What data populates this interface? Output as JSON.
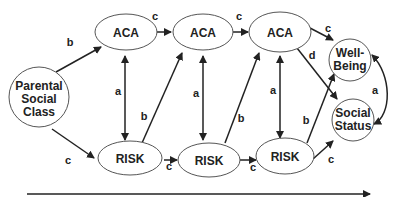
{
  "diagram": {
    "nodes": {
      "parental": {
        "line1": "Parental",
        "line2": "Social",
        "line3": "Class"
      },
      "aca1": {
        "label": "ACA"
      },
      "aca2": {
        "label": "ACA"
      },
      "aca3": {
        "label": "ACA"
      },
      "risk1": {
        "label": "RISK"
      },
      "risk2": {
        "label": "RISK"
      },
      "risk3": {
        "label": "RISK"
      },
      "wellbeing": {
        "line1": "Well-",
        "line2": "Being"
      },
      "socialstatus": {
        "line1": "Social",
        "line2": "Status"
      }
    },
    "edge_labels": {
      "parental_aca1": "b",
      "parental_risk1": "c",
      "aca1_aca2": "c",
      "aca2_aca3": "c",
      "aca3_wellbeing": "c",
      "aca3_socialstatus": "d",
      "risk1_risk2": "c",
      "risk2_risk3": "c",
      "risk3_socialstatus": "c",
      "risk3_wellbeing": "b",
      "risk1_aca2": "b",
      "risk2_aca3": "b",
      "aca1_risk1": "a",
      "aca2_risk2": "a",
      "aca3_risk3": "a",
      "wellbeing_socialstatus": "a"
    },
    "time_axis": "arrow"
  }
}
